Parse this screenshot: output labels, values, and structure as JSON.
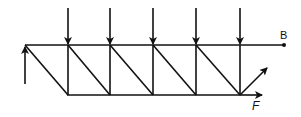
{
  "diagram": {
    "type": "truss",
    "labels": {
      "point_b": "B",
      "force_f": "F"
    },
    "colors": {
      "stroke": "#111111",
      "background": "#ffffff"
    },
    "top_chord": {
      "x1": 25,
      "x2": 284,
      "y": 45
    },
    "bottom_chord": {
      "x1": 67,
      "x2": 240,
      "y": 95
    },
    "verticals_x": [
      68,
      110,
      153,
      196,
      240
    ],
    "load_count": 5,
    "support": "upward reaction arrow at left end"
  }
}
